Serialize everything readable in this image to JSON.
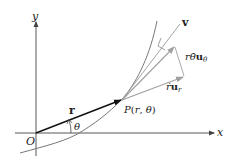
{
  "figure": {
    "type": "polar-velocity-components",
    "axes": {
      "x_label": "x",
      "y_label": "y",
      "origin_label": "O"
    },
    "point": {
      "label": "P(r, θ)",
      "label_parts": [
        "P",
        "(",
        "r",
        ", ",
        "θ",
        ")"
      ]
    },
    "vectors": {
      "position": {
        "label": "r"
      },
      "velocity": {
        "label": "v"
      },
      "transverse": {
        "label_r": "r",
        "label_thetadot": "θ̇",
        "label_u": "u",
        "label_sub": "θ"
      },
      "radial": {
        "label_rdot": "ṙ",
        "label_u": "u",
        "label_sub": "r"
      }
    },
    "angle": {
      "label": "θ"
    },
    "colors": {
      "axes": "#444444",
      "curve": "#777777",
      "position_vector": "#111111",
      "component_vectors": "#999999",
      "text": "#222222"
    }
  }
}
